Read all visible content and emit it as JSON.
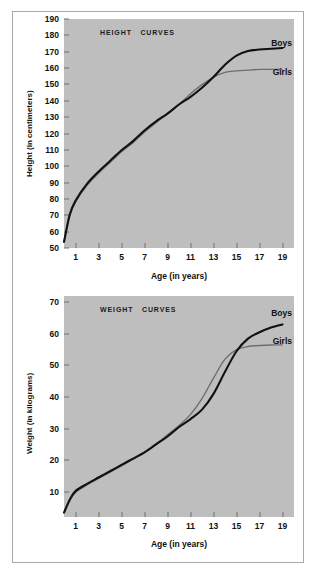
{
  "figure": {
    "background": "#ffffff",
    "border_color": "#a9a9a9",
    "plot_background": "#bebebe"
  },
  "series_colors": {
    "boys": "#111111",
    "girls": "#6e6e6e"
  },
  "charts": [
    {
      "id": "height",
      "title": "HEIGHT   CURVES",
      "ylabel": "Height (in centimeters)",
      "xlabel": "Age (in years)",
      "yticks": [
        "190",
        "180",
        "170",
        "160",
        "150",
        "140",
        "130",
        "120",
        "110",
        "100",
        "90",
        "80",
        "70",
        "60",
        "50"
      ],
      "xticks": [
        "1",
        "3",
        "5",
        "7",
        "9",
        "11",
        "13",
        "15",
        "17",
        "19"
      ],
      "boys_label": "Boys",
      "girls_label": "Girls"
    },
    {
      "id": "weight",
      "title": "WEIGHT   CURVES",
      "ylabel": "Weight (in kilograms)",
      "xlabel": "Age (in years)",
      "yticks": [
        "70",
        "60",
        "50",
        "40",
        "30",
        "20",
        "10"
      ],
      "xticks": [
        "1",
        "3",
        "5",
        "7",
        "9",
        "11",
        "13",
        "15",
        "17",
        "19"
      ],
      "boys_label": "Boys",
      "girls_label": "Girls"
    }
  ],
  "chart_data": [
    {
      "type": "line",
      "title": "HEIGHT   CURVES",
      "xlabel": "Age (in years)",
      "ylabel": "Height (in centimeters)",
      "xlim": [
        0,
        20
      ],
      "ylim": [
        45,
        195
      ],
      "ytick_values": [
        50,
        60,
        70,
        80,
        90,
        100,
        110,
        120,
        130,
        140,
        150,
        160,
        170,
        180,
        190
      ],
      "xtick_values": [
        1,
        3,
        5,
        7,
        9,
        11,
        13,
        15,
        17,
        19
      ],
      "grid": false,
      "legend": "inline-right",
      "x": [
        0,
        0.5,
        1,
        2,
        3,
        4,
        5,
        6,
        7,
        8,
        9,
        10,
        11,
        12,
        13,
        14,
        15,
        16,
        17,
        18,
        19
      ],
      "series": [
        {
          "name": "Boys",
          "color": "#111111",
          "values": [
            49,
            67,
            76,
            87,
            95,
            102,
            109,
            115,
            122,
            128,
            133,
            139,
            144,
            150,
            157,
            165,
            171,
            174,
            175,
            175.5,
            176
          ]
        },
        {
          "name": "Girls",
          "color": "#6e6e6e",
          "values": [
            49,
            66,
            75,
            86,
            94,
            101,
            108,
            114,
            121,
            127,
            133,
            139,
            146,
            152,
            157,
            160,
            161,
            161.5,
            162,
            162,
            162
          ]
        }
      ]
    },
    {
      "type": "line",
      "title": "WEIGHT   CURVES",
      "xlabel": "Age (in years)",
      "ylabel": "Weight (in kilograms)",
      "xlim": [
        0,
        20
      ],
      "ylim": [
        2,
        72
      ],
      "ytick_values": [
        10,
        20,
        30,
        40,
        50,
        60,
        70
      ],
      "xtick_values": [
        1,
        3,
        5,
        7,
        9,
        11,
        13,
        15,
        17,
        19
      ],
      "grid": false,
      "legend": "inline-right",
      "x": [
        0,
        0.5,
        1,
        2,
        3,
        4,
        5,
        6,
        7,
        8,
        9,
        10,
        11,
        12,
        13,
        14,
        15,
        16,
        17,
        18,
        19
      ],
      "series": [
        {
          "name": "Boys",
          "color": "#111111",
          "values": [
            3.4,
            7.5,
            10.2,
            12.5,
            14.5,
            16.5,
            18.5,
            20.5,
            22.5,
            25,
            27.5,
            30.5,
            33,
            36,
            41,
            48,
            54.5,
            58.5,
            60.5,
            62,
            63
          ]
        },
        {
          "name": "Girls",
          "color": "#6e6e6e",
          "values": [
            3.3,
            7.2,
            9.8,
            12.2,
            14.2,
            16.2,
            18.2,
            20.3,
            22.5,
            25,
            28,
            31,
            34.5,
            39.5,
            46,
            52,
            55,
            56,
            56.3,
            56.5,
            56.5
          ]
        }
      ]
    }
  ]
}
